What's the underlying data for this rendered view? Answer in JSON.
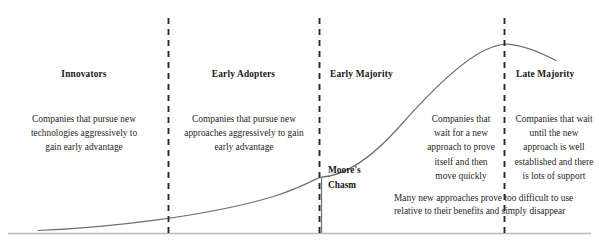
{
  "diagram": {
    "type": "annotated-curve",
    "colors": {
      "background": "#ffffff",
      "curve": "#6f6f6f",
      "baseline": "#b8b8b8",
      "divider": "#2b2b2b",
      "text": "#1f1f1f",
      "heading_text": "#171717"
    },
    "segments": [
      {
        "id": "innovators",
        "heading": "Innovators",
        "body": "Companies that pursue new technologies aggressively to gain early advantage",
        "align": "center"
      },
      {
        "id": "early-adopters",
        "heading": "Early Adopters",
        "body": "Companies that pursue new approaches aggressively to gain early advantage",
        "align": "center"
      },
      {
        "id": "early-majority",
        "heading": "Early Majority",
        "body": "Companies that wait for a new approach to prove itself and then move quickly",
        "align": "center"
      },
      {
        "id": "late-majority",
        "heading": "Late Majority",
        "body": "Companies that wait until the new approach is well established and there is lots of support",
        "align": "center"
      }
    ],
    "chasm": {
      "label": "Moore's Chasm",
      "note": "Many new approaches prove too difficult to use relative to their benefits and simply disappear"
    },
    "dividers": [
      {
        "id": "divider-1",
        "x": 168
      },
      {
        "id": "divider-2",
        "x": 319
      },
      {
        "id": "divider-3",
        "x": 504
      }
    ]
  }
}
